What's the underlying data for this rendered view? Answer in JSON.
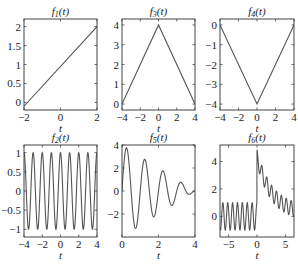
{
  "figure": {
    "rows": 2,
    "cols": 3,
    "background": "#ffffff",
    "line_color": "#555555"
  },
  "chart_data": [
    {
      "id": "f1",
      "type": "line",
      "title": "f1(t)",
      "title_main": "f",
      "title_sub": "1",
      "title_arg": "(t)",
      "xlabel": "t",
      "ylabel": "",
      "xlim": [
        -2,
        2
      ],
      "ylim": [
        -0.2,
        2.2
      ],
      "xticks": [
        -2,
        0,
        2
      ],
      "yticks": [
        0,
        0.5,
        1,
        1.5,
        2
      ],
      "xticklabels": [
        "−2",
        "0",
        "2"
      ],
      "yticklabels": [
        "0",
        "0.5",
        "1",
        "1.5",
        "2"
      ],
      "box": [
        24,
        19,
        97,
        110
      ],
      "expr": "linear",
      "x": [
        -2,
        2
      ],
      "y": [
        -0.1,
        2.0
      ]
    },
    {
      "id": "f3",
      "type": "line",
      "title": "f3(t)",
      "title_main": "f",
      "title_sub": "3",
      "title_arg": "(t)",
      "xlabel": "t",
      "ylabel": "",
      "xlim": [
        -4,
        4
      ],
      "ylim": [
        -0.3,
        4.3
      ],
      "xticks": [
        -4,
        -2,
        0,
        2,
        4
      ],
      "yticks": [
        0,
        1,
        2,
        3,
        4
      ],
      "xticklabels": [
        "−4",
        "−2",
        "0",
        "2",
        "4"
      ],
      "yticklabels": [
        "0",
        "1",
        "2",
        "3",
        "4"
      ],
      "box": [
        122,
        19,
        195,
        110
      ],
      "x": [
        -4,
        0,
        4
      ],
      "y": [
        0,
        4,
        0
      ]
    },
    {
      "id": "f4",
      "type": "line",
      "title": "f4(t)",
      "title_main": "f",
      "title_sub": "4",
      "title_arg": "(t)",
      "xlabel": "t",
      "ylabel": "",
      "xlim": [
        -4,
        4
      ],
      "ylim": [
        -4.3,
        0.3
      ],
      "xticks": [
        -4,
        -2,
        0,
        2,
        4
      ],
      "yticks": [
        0,
        -1,
        -2,
        -3,
        -4
      ],
      "xticklabels": [
        "−4",
        "−2",
        "0",
        "2",
        "4"
      ],
      "yticklabels": [
        "0",
        "−1",
        "−2",
        "−3",
        "−4"
      ],
      "box": [
        220,
        19,
        294,
        110
      ],
      "x": [
        -4,
        0,
        4
      ],
      "y": [
        0,
        -4,
        0
      ]
    },
    {
      "id": "f2",
      "type": "line",
      "title": "f2(t)",
      "title_main": "f",
      "title_sub": "2",
      "title_arg": "(t)",
      "xlabel": "t",
      "ylabel": "",
      "xlim": [
        -4,
        4
      ],
      "ylim": [
        -1.2,
        1.2
      ],
      "xticks": [
        -4,
        -2,
        0,
        2,
        4
      ],
      "yticks": [
        1,
        0.5,
        0,
        -0.5,
        -1
      ],
      "xticklabels": [
        "−4",
        "−2",
        "0",
        "2",
        "4"
      ],
      "yticklabels": [
        "1",
        "0.5",
        "0",
        "−0.5",
        "−1"
      ],
      "box": [
        24,
        145,
        97,
        237
      ],
      "expr": "cos(2*pi*t)",
      "description": "cosine, period 1, amplitude 1"
    },
    {
      "id": "f5",
      "type": "line",
      "title": "f5(t)",
      "title_main": "f",
      "title_sub": "5",
      "title_arg": "(t)",
      "xlabel": "t",
      "ylabel": "",
      "xlim": [
        0,
        4
      ],
      "ylim": [
        -4,
        4
      ],
      "xticks": [
        0,
        2,
        4
      ],
      "yticks": [
        4,
        2,
        0,
        -2
      ],
      "xticklabels": [
        "0",
        "2",
        "4"
      ],
      "yticklabels": [
        "4",
        "2",
        "0",
        "−2"
      ],
      "box": [
        122,
        145,
        195,
        237
      ],
      "expr": "(4-t)*sin(2*pi*t)",
      "description": "linearly damped sine, peaks ≈3.7, 2.7, 1.7, 0.7; troughs ≈−3.3, −2.3, −1.3, −0.3"
    },
    {
      "id": "f6",
      "type": "line",
      "title": "f6(t)",
      "title_main": "f",
      "title_sub": "6",
      "title_arg": "(t)",
      "xlabel": "t",
      "ylabel": "",
      "xlim": [
        -6.5,
        6.5
      ],
      "ylim": [
        -1.5,
        5.2
      ],
      "xticks": [
        -5,
        0,
        5
      ],
      "yticks": [
        4,
        2,
        0
      ],
      "xticklabels": [
        "−5",
        "0",
        "5"
      ],
      "yticklabels": [
        "4",
        "2",
        "0"
      ],
      "box": [
        220,
        145,
        294,
        237
      ],
      "expr": "cos(2*pi*t/0.857) + (t>=0)*4*exp(-t/2.5)",
      "description": "oscillation ±1 for t<0; jump to ≈4.7 at t=0 then decays with ripple toward 0"
    }
  ]
}
